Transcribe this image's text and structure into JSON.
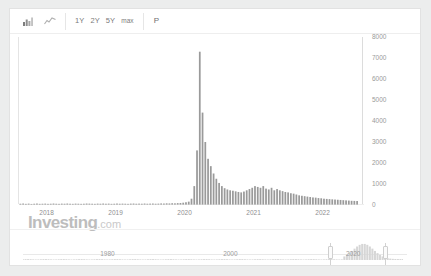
{
  "toolbar": {
    "bar_chart_icon": "bar-chart-icon",
    "line_chart_icon": "line-chart-icon",
    "ranges": [
      {
        "label": "1Y"
      },
      {
        "label": "2Y"
      },
      {
        "label": "5Y"
      },
      {
        "label": "max"
      }
    ],
    "percent_label": "P"
  },
  "watermark": {
    "brand": "Investing",
    "suffix": ".com"
  },
  "navigator": {
    "labels": [
      "1980",
      "2000",
      "2020"
    ],
    "label_positions": [
      0.22,
      0.54,
      0.86
    ],
    "selection_start": 0.8,
    "selection_end": 0.94,
    "range_text": "2020"
  },
  "chart_data": {
    "type": "bar",
    "title": "",
    "xlabel": "",
    "ylabel": "",
    "ylim": [
      0,
      8000
    ],
    "yticks": [
      0,
      1000,
      2000,
      3000,
      4000,
      5000,
      6000,
      7000,
      8000
    ],
    "ytick_labels": [
      "0",
      "1000",
      "2000",
      "3000",
      "4000",
      "5000",
      "6000",
      "7000",
      "8000"
    ],
    "xlim": [
      2017.6,
      2022.6
    ],
    "xticks": [
      2018,
      2019,
      2020,
      2021,
      2022
    ],
    "xtick_labels": [
      "2018",
      "2019",
      "2020",
      "2021",
      "2022"
    ],
    "grid": false,
    "legend": "none",
    "bar_color": "#9a9a9a",
    "x": [
      2017.62,
      2017.66,
      2017.7,
      2017.74,
      2017.78,
      2017.82,
      2017.86,
      2017.9,
      2017.94,
      2017.98,
      2018.02,
      2018.06,
      2018.1,
      2018.14,
      2018.18,
      2018.22,
      2018.26,
      2018.3,
      2018.34,
      2018.38,
      2018.42,
      2018.46,
      2018.5,
      2018.54,
      2018.58,
      2018.62,
      2018.66,
      2018.7,
      2018.74,
      2018.78,
      2018.82,
      2018.86,
      2018.9,
      2018.94,
      2018.98,
      2019.02,
      2019.06,
      2019.1,
      2019.14,
      2019.18,
      2019.22,
      2019.26,
      2019.3,
      2019.34,
      2019.38,
      2019.42,
      2019.46,
      2019.5,
      2019.54,
      2019.58,
      2019.62,
      2019.66,
      2019.7,
      2019.74,
      2019.78,
      2019.82,
      2019.86,
      2019.9,
      2019.94,
      2019.98,
      2020.02,
      2020.06,
      2020.1,
      2020.14,
      2020.18,
      2020.22,
      2020.26,
      2020.3,
      2020.34,
      2020.38,
      2020.42,
      2020.46,
      2020.5,
      2020.54,
      2020.58,
      2020.62,
      2020.66,
      2020.7,
      2020.74,
      2020.78,
      2020.82,
      2020.86,
      2020.9,
      2020.94,
      2020.98,
      2021.02,
      2021.06,
      2021.1,
      2021.14,
      2021.18,
      2021.22,
      2021.26,
      2021.3,
      2021.34,
      2021.38,
      2021.42,
      2021.46,
      2021.5,
      2021.54,
      2021.58,
      2021.62,
      2021.66,
      2021.7,
      2021.74,
      2021.78,
      2021.82,
      2021.86,
      2021.9,
      2021.94,
      2021.98,
      2022.02,
      2022.06,
      2022.1,
      2022.14,
      2022.18,
      2022.22,
      2022.26,
      2022.3,
      2022.34,
      2022.38,
      2022.42,
      2022.46,
      2022.5
    ],
    "values": [
      60,
      70,
      55,
      65,
      50,
      60,
      70,
      55,
      60,
      65,
      55,
      60,
      70,
      60,
      55,
      65,
      60,
      70,
      60,
      55,
      65,
      60,
      55,
      60,
      70,
      65,
      60,
      55,
      65,
      60,
      70,
      60,
      65,
      55,
      60,
      70,
      60,
      65,
      60,
      55,
      65,
      70,
      60,
      65,
      60,
      70,
      60,
      65,
      70,
      60,
      65,
      75,
      70,
      80,
      75,
      85,
      80,
      90,
      95,
      110,
      130,
      160,
      300,
      900,
      2600,
      7300,
      4400,
      3000,
      2200,
      1850,
      1500,
      1250,
      1050,
      900,
      800,
      740,
      700,
      680,
      650,
      620,
      600,
      640,
      700,
      760,
      820,
      900,
      860,
      820,
      900,
      780,
      740,
      820,
      700,
      760,
      700,
      660,
      620,
      600,
      560,
      540,
      500,
      460,
      440,
      420,
      400,
      380,
      360,
      350,
      330,
      320,
      300,
      290,
      280,
      270,
      260,
      250,
      240,
      230,
      220,
      210,
      200,
      195,
      190
    ]
  }
}
